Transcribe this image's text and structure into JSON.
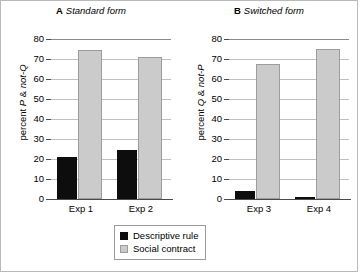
{
  "chart_data": {
    "type": "bar",
    "title": "",
    "panels": [
      {
        "tag": "A",
        "title": "Standard form",
        "ylabel_plain": "percent P & not-Q",
        "ylabel_prefix": "percent ",
        "ylabel_em1": "P",
        "ylabel_mid": " & ",
        "ylabel_em2": "not-Q",
        "categories": [
          "Exp 1",
          "Exp 2"
        ],
        "series": [
          {
            "name": "Descriptive rule",
            "color": "#0d0d0d",
            "values": [
              21,
              24.5
            ]
          },
          {
            "name": "Social contract",
            "color": "#cbcbcb",
            "values": [
              74.5,
              71
            ]
          }
        ],
        "ylim": [
          0,
          80
        ],
        "yticks": [
          0,
          10,
          20,
          30,
          40,
          50,
          60,
          70,
          80
        ],
        "grid": true
      },
      {
        "tag": "B",
        "title": "Switched form",
        "ylabel_plain": "percent Q & not-P",
        "ylabel_prefix": "percent ",
        "ylabel_em1": "Q",
        "ylabel_mid": " & ",
        "ylabel_em2": "not-P",
        "categories": [
          "Exp 3",
          "Exp 4"
        ],
        "series": [
          {
            "name": "Descriptive rule",
            "color": "#0d0d0d",
            "values": [
              4,
              0.5
            ]
          },
          {
            "name": "Social contract",
            "color": "#cbcbcb",
            "values": [
              67.5,
              75
            ]
          }
        ],
        "ylim": [
          0,
          80
        ],
        "yticks": [
          0,
          10,
          20,
          30,
          40,
          50,
          60,
          70,
          80
        ],
        "grid": true
      }
    ],
    "legend": {
      "position": "bottom-center",
      "entries": [
        {
          "label": "Descriptive rule",
          "color": "#0d0d0d"
        },
        {
          "label": "Social contract",
          "color": "#cbcbcb"
        }
      ]
    },
    "xlabel": "",
    "ylabel": "percent"
  },
  "ytick_labels": [
    "80",
    "70",
    "60",
    "50",
    "40",
    "30",
    "20",
    "10",
    "0"
  ]
}
